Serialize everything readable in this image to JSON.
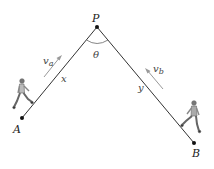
{
  "diagram": {
    "type": "geometry-motion",
    "points": {
      "P": {
        "label": "P",
        "x": 97,
        "y": 27
      },
      "A": {
        "label": "A",
        "x": 22,
        "y": 118
      },
      "B": {
        "label": "B",
        "x": 194,
        "y": 143
      }
    },
    "segments": [
      {
        "from": "A",
        "to": "P",
        "label": "x"
      },
      {
        "from": "P",
        "to": "B",
        "label": "y"
      }
    ],
    "angle": {
      "vertex": "P",
      "label": "θ"
    },
    "velocities": [
      {
        "label": "v",
        "subscript": "a",
        "direction": "A-to-P"
      },
      {
        "label": "v",
        "subscript": "b",
        "direction": "B-to-P"
      }
    ],
    "figures": [
      {
        "name": "walker-a",
        "near": "A"
      },
      {
        "name": "walker-b",
        "near": "B"
      }
    ],
    "colors": {
      "line": "#333333",
      "arrow": "#999999",
      "point": "#111111"
    }
  }
}
